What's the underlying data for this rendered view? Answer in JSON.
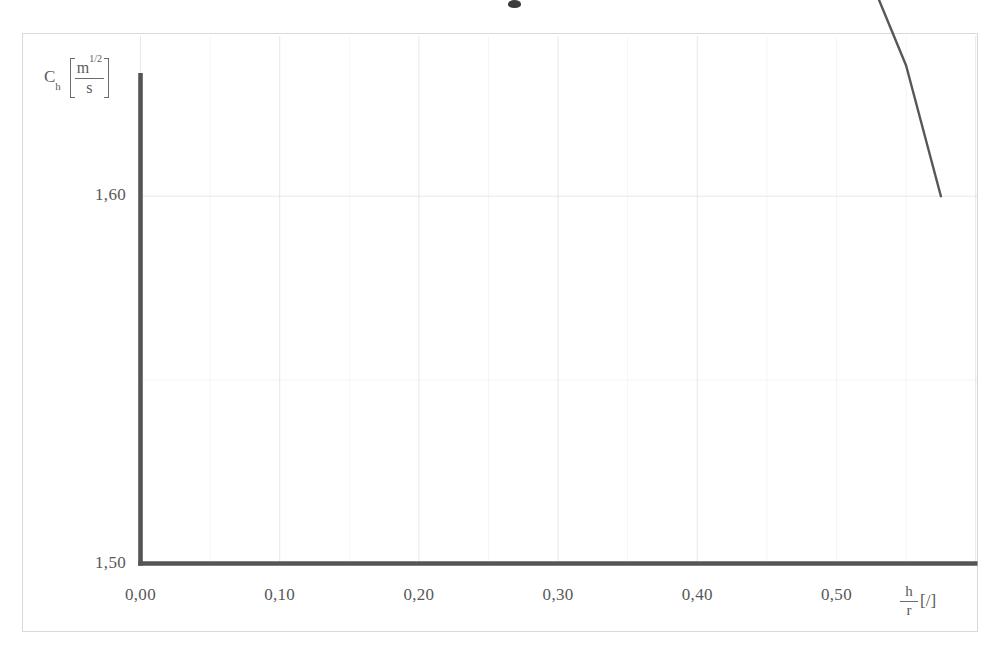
{
  "figure": {
    "name": "discharge-coefficient-chart",
    "background_color": "#ffffff",
    "frame_color": "#d9d9d9"
  },
  "axes": {
    "y": {
      "symbol": "C",
      "subscript": "h",
      "unit_numerator": "m",
      "unit_numerator_exponent": "1/2",
      "unit_denominator": "s",
      "ticks": [
        "1,80",
        "1,70",
        "1,60",
        "1,50"
      ]
    },
    "x": {
      "symbol_numerator": "h",
      "symbol_denominator": "r",
      "unit": "[/]",
      "ticks": [
        "0,00",
        "0,10",
        "0,20",
        "0,30",
        "0,40",
        "0,50"
      ]
    }
  },
  "chart_data": {
    "type": "line",
    "title": "",
    "xlabel": "h/r [/]",
    "ylabel": "C_h [m^(1/2)/s]",
    "xlim": [
      0.0,
      0.603
    ],
    "ylim": [
      1.5,
      1.91
    ],
    "xticks": [
      0.0,
      0.1,
      0.2,
      0.3,
      0.4,
      0.5
    ],
    "xticklabels": [
      "0,00",
      "0,10",
      "0,20",
      "0,30",
      "0,40",
      "0,50"
    ],
    "yticks": [
      1.5,
      1.6,
      1.7,
      1.8
    ],
    "yticklabels": [
      "1,50",
      "1,60",
      "1,70",
      "1,80"
    ],
    "grid": true,
    "minor_grid": true,
    "legend": null,
    "line_color": "#4a4a4a",
    "line_width": 2.4,
    "series": [
      {
        "name": "Ch",
        "x": [
          0.0,
          0.025,
          0.05,
          0.075,
          0.1,
          0.125,
          0.15,
          0.175,
          0.2,
          0.225,
          0.25,
          0.275,
          0.3,
          0.325,
          0.35,
          0.375,
          0.4,
          0.425,
          0.45,
          0.475,
          0.5,
          0.525,
          0.55,
          0.575
        ],
        "y": [
          1.8485,
          1.8452,
          1.8418,
          1.8383,
          1.8346,
          1.8306,
          1.8263,
          1.8216,
          1.8163,
          1.8104,
          1.8037,
          1.7962,
          1.7878,
          1.7784,
          1.768,
          1.7566,
          1.744,
          1.7301,
          1.7148,
          1.6979,
          1.6792,
          1.6585,
          1.6356,
          1.6
        ]
      }
    ]
  }
}
